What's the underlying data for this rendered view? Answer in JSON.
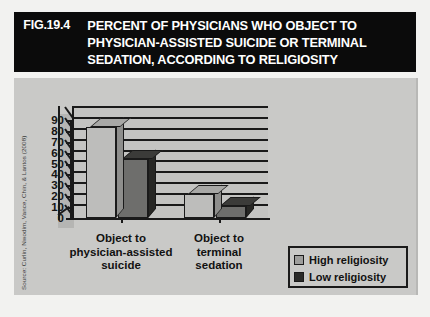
{
  "figure": {
    "number": "FIG.19.4",
    "title_lines": [
      "PERCENT OF PHYSICIANS WHO OBJECT TO",
      "PHYSICIAN-ASSISTED SUICIDE OR TERMINAL",
      "SEDATION, ACCORDING TO RELIGIOSITY"
    ],
    "source": "Source: Curlin, Nwodim, Vance, Chin, & Lantos (2008)"
  },
  "colors": {
    "title_bg": "#0b0b0b",
    "title_fg": "#ffffff",
    "panel_bg": "#c9c9c7",
    "high_religiosity": "#bdbdbb",
    "low_religiosity": "#6e6e6c",
    "axis": "#1a1a1a"
  },
  "chart_data": {
    "type": "bar",
    "title": "PERCENT OF PHYSICIANS WHO OBJECT TO PHYSICIAN-ASSISTED SUICIDE OR TERMINAL SEDATION, ACCORDING TO RELIGIOSITY",
    "categories": [
      "Object to\nphysician-assisted\nsuicide",
      "Object to\nterminal\nsedation"
    ],
    "category_lines": [
      [
        "Object to",
        "physician-assisted",
        "suicide"
      ],
      [
        "Object to",
        "terminal",
        "sedation"
      ]
    ],
    "series": [
      {
        "name": "High religiosity",
        "values": [
          84,
          22
        ]
      },
      {
        "name": "Low religiosity",
        "values": [
          54,
          11
        ]
      }
    ],
    "xlabel": "",
    "ylabel": "",
    "ylim": [
      0,
      90
    ],
    "yticks": [
      0,
      10,
      20,
      30,
      40,
      50,
      60,
      70,
      80,
      90
    ],
    "ytick_labels": [
      "0",
      "10",
      "20",
      "30",
      "40",
      "50",
      "60",
      "70",
      "80",
      "90"
    ],
    "grid": true,
    "legend_position": "bottom-right",
    "three_d": true
  },
  "legend": {
    "items": [
      {
        "label": "High religiosity",
        "swatch": "high"
      },
      {
        "label": "Low religiosity",
        "swatch": "low"
      }
    ]
  }
}
